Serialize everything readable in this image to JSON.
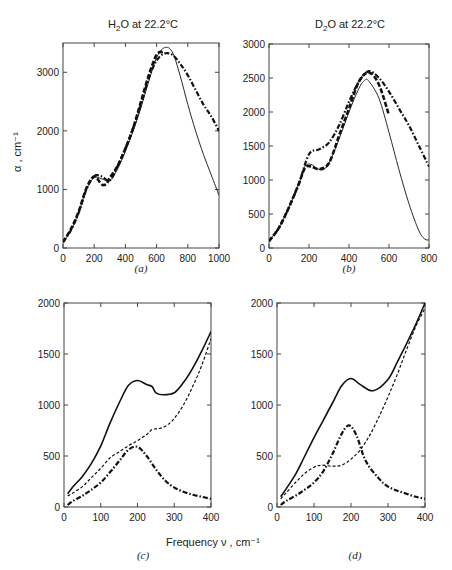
{
  "titles": {
    "a": "H2O at 22.2°C",
    "b": "D2O at 22.2°C"
  },
  "panel_labels": [
    "(a)",
    "(b)",
    "(c)",
    "(d)"
  ],
  "shared_xlabel": "Frequency ν , cm⁻¹",
  "ylabel": "α , cm⁻¹",
  "chart_data": [
    {
      "panel": "a",
      "type": "line",
      "title": "H2O at 22.2°C",
      "xlabel": "",
      "ylabel": "α, cm⁻¹",
      "xlim": [
        0,
        1000
      ],
      "ylim": [
        0,
        3500
      ],
      "xticks": [
        0,
        200,
        400,
        600,
        800,
        1000
      ],
      "yticks": [
        0,
        1000,
        2000,
        3000
      ],
      "grid": false,
      "series": [
        {
          "name": "solid",
          "style": "solid-thin",
          "x": [
            0,
            50,
            100,
            150,
            200,
            250,
            300,
            350,
            400,
            450,
            500,
            550,
            600,
            650,
            700,
            750,
            800,
            850,
            900,
            950,
            1000
          ],
          "y": [
            100,
            300,
            600,
            1000,
            1200,
            1180,
            1150,
            1350,
            1650,
            2000,
            2400,
            2850,
            3250,
            3420,
            3350,
            2950,
            2450,
            2000,
            1600,
            1250,
            900
          ]
        },
        {
          "name": "dashed",
          "style": "dashed-bold",
          "x": [
            0,
            50,
            100,
            150,
            200,
            250,
            280,
            300,
            350,
            400,
            450,
            500,
            550,
            600,
            640
          ],
          "y": [
            100,
            320,
            620,
            1020,
            1220,
            1080,
            1100,
            1200,
            1400,
            1700,
            2050,
            2500,
            2950,
            3300,
            3350
          ]
        },
        {
          "name": "dash-dot",
          "style": "dashdot-bold",
          "x": [
            0,
            50,
            100,
            150,
            200,
            250,
            300,
            350,
            400,
            450,
            500,
            550,
            600,
            650,
            700,
            750,
            800,
            850,
            900,
            950,
            1000
          ],
          "y": [
            100,
            300,
            600,
            1000,
            1230,
            1220,
            1150,
            1400,
            1700,
            2050,
            2450,
            2900,
            3200,
            3320,
            3300,
            3150,
            2950,
            2700,
            2450,
            2250,
            2000
          ]
        }
      ]
    },
    {
      "panel": "b",
      "type": "line",
      "title": "D2O at 22.2°C",
      "xlim": [
        0,
        800
      ],
      "ylim": [
        0,
        3000
      ],
      "xticks": [
        0,
        200,
        400,
        600,
        800
      ],
      "yticks": [
        0,
        500,
        1000,
        1500,
        2000,
        2500,
        3000
      ],
      "grid": false,
      "series": [
        {
          "name": "solid",
          "style": "solid-thin",
          "x": [
            0,
            50,
            100,
            150,
            180,
            210,
            240,
            270,
            300,
            350,
            400,
            450,
            480,
            500,
            550,
            600,
            650,
            700,
            750,
            780,
            800
          ],
          "y": [
            100,
            300,
            600,
            950,
            1200,
            1230,
            1170,
            1150,
            1250,
            1600,
            2000,
            2350,
            2470,
            2450,
            2200,
            1700,
            1150,
            650,
            250,
            130,
            120
          ]
        },
        {
          "name": "dashed",
          "style": "dashed-bold",
          "x": [
            0,
            50,
            100,
            150,
            180,
            210,
            250,
            300,
            350,
            400,
            450,
            500,
            550,
            600
          ],
          "y": [
            100,
            300,
            600,
            950,
            1180,
            1200,
            1160,
            1250,
            1650,
            2050,
            2450,
            2580,
            2400,
            1950
          ]
        },
        {
          "name": "dash-dot",
          "style": "dashdot-bold",
          "x": [
            0,
            50,
            100,
            150,
            200,
            250,
            300,
            350,
            400,
            450,
            500,
            550,
            600,
            650,
            700,
            750,
            800
          ],
          "y": [
            100,
            300,
            600,
            950,
            1380,
            1450,
            1550,
            1800,
            2150,
            2450,
            2600,
            2500,
            2300,
            2050,
            1800,
            1500,
            1200
          ]
        }
      ]
    },
    {
      "panel": "c",
      "type": "line",
      "xlabel": "Frequency ν, cm⁻¹",
      "xlim": [
        0,
        400
      ],
      "ylim": [
        0,
        2000
      ],
      "xticks": [
        0,
        100,
        200,
        300,
        400
      ],
      "yticks": [
        0,
        500,
        1000,
        1500,
        2000
      ],
      "grid": false,
      "series": [
        {
          "name": "solid",
          "style": "solid-bold",
          "x": [
            10,
            25,
            50,
            75,
            100,
            125,
            150,
            175,
            200,
            225,
            240,
            250,
            270,
            300,
            325,
            350,
            375,
            400
          ],
          "y": [
            130,
            200,
            300,
            430,
            600,
            820,
            1020,
            1190,
            1240,
            1200,
            1180,
            1120,
            1100,
            1120,
            1220,
            1360,
            1530,
            1720
          ]
        },
        {
          "name": "dashed",
          "style": "dashed",
          "x": [
            10,
            25,
            50,
            75,
            100,
            125,
            150,
            175,
            200,
            225,
            240,
            260,
            280,
            300,
            325,
            350,
            375,
            400
          ],
          "y": [
            110,
            140,
            200,
            290,
            380,
            480,
            540,
            600,
            650,
            710,
            760,
            770,
            800,
            870,
            1000,
            1180,
            1390,
            1650
          ]
        },
        {
          "name": "dash-dot",
          "style": "dashdot-bold",
          "x": [
            10,
            25,
            50,
            75,
            100,
            125,
            150,
            175,
            200,
            225,
            250,
            275,
            300,
            325,
            350,
            375,
            400
          ],
          "y": [
            20,
            60,
            110,
            170,
            240,
            340,
            450,
            560,
            590,
            500,
            370,
            260,
            190,
            150,
            120,
            100,
            80
          ]
        }
      ]
    },
    {
      "panel": "d",
      "type": "line",
      "xlabel": "Frequency ν, cm⁻¹",
      "xlim": [
        0,
        400
      ],
      "ylim": [
        0,
        2000
      ],
      "xticks": [
        0,
        100,
        200,
        300,
        400
      ],
      "yticks": [
        0,
        500,
        1000,
        1500,
        2000
      ],
      "grid": false,
      "series": [
        {
          "name": "solid",
          "style": "solid-bold",
          "x": [
            10,
            25,
            50,
            75,
            100,
            125,
            150,
            175,
            200,
            225,
            260,
            300,
            325,
            350,
            375,
            400
          ],
          "y": [
            100,
            180,
            320,
            500,
            680,
            850,
            1020,
            1190,
            1260,
            1200,
            1140,
            1250,
            1420,
            1600,
            1790,
            2000
          ]
        },
        {
          "name": "dashed",
          "style": "dashed",
          "x": [
            10,
            25,
            50,
            75,
            100,
            120,
            150,
            175,
            200,
            225,
            250,
            275,
            300,
            325,
            350,
            375,
            400
          ],
          "y": [
            80,
            140,
            240,
            330,
            390,
            410,
            400,
            410,
            470,
            560,
            700,
            880,
            1080,
            1300,
            1540,
            1770,
            1950
          ]
        },
        {
          "name": "dash-dot",
          "style": "dashdot-bold",
          "x": [
            10,
            25,
            50,
            75,
            100,
            125,
            150,
            175,
            195,
            215,
            240,
            275,
            300,
            325,
            350,
            375,
            400
          ],
          "y": [
            20,
            60,
            110,
            170,
            240,
            350,
            520,
            720,
            800,
            700,
            450,
            280,
            200,
            160,
            130,
            100,
            80
          ]
        }
      ]
    }
  ]
}
